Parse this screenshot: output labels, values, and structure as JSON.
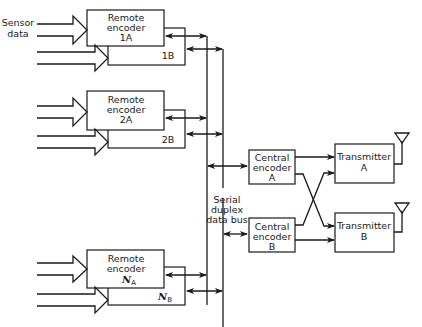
{
  "diagram": {
    "sensor_label": [
      "Sensor",
      "data"
    ],
    "remote_encoders": [
      {
        "label_lines": [
          "Remote",
          "encoder",
          "1A"
        ],
        "backup_label": "1B"
      },
      {
        "label_lines": [
          "Remote",
          "encoder",
          "2A"
        ],
        "backup_label": "2B"
      },
      {
        "label_lines": [
          "Remote",
          "encoder",
          "N",
          "A"
        ],
        "backup_label_main": "N",
        "backup_label_sub": "B"
      }
    ],
    "bus_label": [
      "Serial",
      "duplex",
      "data bus"
    ],
    "central_encoders": [
      {
        "label_lines": [
          "Central",
          "encoder",
          "A"
        ]
      },
      {
        "label_lines": [
          "Central",
          "encoder",
          "B"
        ]
      }
    ],
    "transmitters": [
      {
        "label_lines": [
          "Transmitter",
          "A"
        ]
      },
      {
        "label_lines": [
          "Transmitter",
          "B"
        ]
      }
    ],
    "colors": {
      "line": "#1a1a1a",
      "background": "#ffffff"
    }
  }
}
